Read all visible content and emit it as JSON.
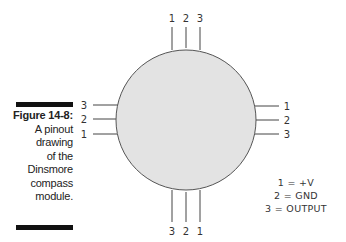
{
  "caption": {
    "title": "Figure 14-8:",
    "lines": [
      "A pinout",
      "drawing",
      "of the",
      "Dinsmore",
      "compass",
      "module."
    ]
  },
  "diagram": {
    "top_pins": [
      "1",
      "2",
      "3"
    ],
    "bottom_pins": [
      "3",
      "2",
      "1"
    ],
    "left_pins": [
      "3",
      "2",
      "1"
    ],
    "right_pins": [
      "1",
      "2",
      "3"
    ],
    "body_color": "#e3e3e3",
    "line_color": "#444444"
  },
  "legend": {
    "items": [
      "1 = +V",
      "2 = GND",
      "3 = OUTPUT"
    ]
  }
}
